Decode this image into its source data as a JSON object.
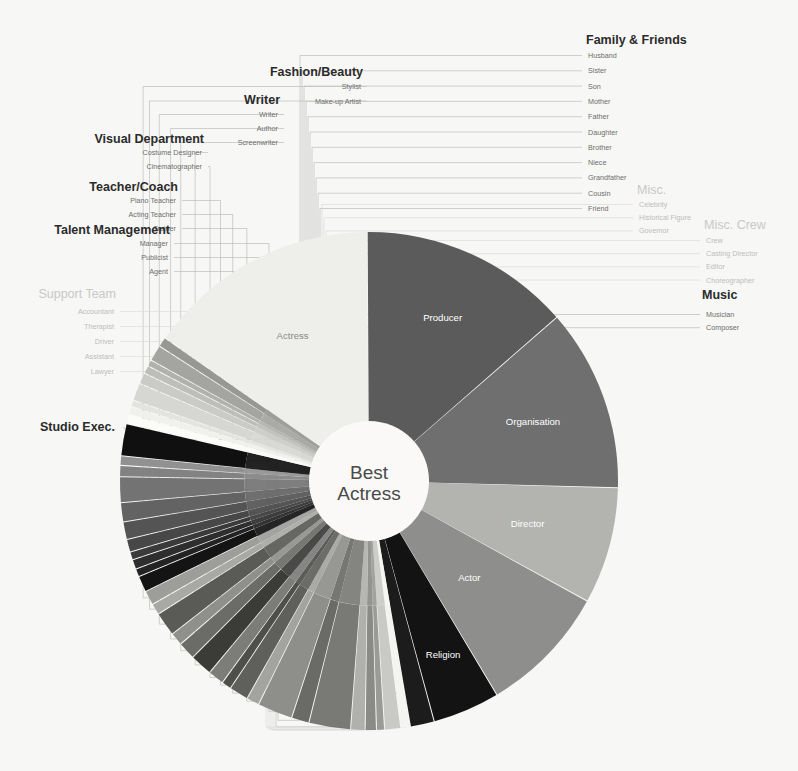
{
  "center": {
    "line1": "Best",
    "line2": "Actress"
  },
  "groups": [
    {
      "id": "family-friends",
      "title": "Family & Friends",
      "muted": false,
      "items": [
        "Husband",
        "Sister",
        "Son",
        "Mother",
        "Father",
        "Daughter",
        "Brother",
        "Niece",
        "Grandfather",
        "Cousin",
        "Friend"
      ]
    },
    {
      "id": "misc",
      "title": "Misc.",
      "muted": true,
      "items": [
        "Celebrity",
        "Historical Figure",
        "Governor"
      ]
    },
    {
      "id": "misc-crew",
      "title": "Misc. Crew",
      "muted": true,
      "items": [
        "Crew",
        "Casting Director",
        "Editor",
        "Choreographer"
      ]
    },
    {
      "id": "music",
      "title": "Music",
      "muted": false,
      "items": [
        "Musician",
        "Composer"
      ]
    },
    {
      "id": "fashion-beauty",
      "title": "Fashion/Beauty",
      "muted": false,
      "items": [
        "Stylist",
        "Make-up Artist"
      ]
    },
    {
      "id": "writer",
      "title": "Writer",
      "muted": false,
      "items": [
        "Writer",
        "Author",
        "Screenwriter"
      ]
    },
    {
      "id": "visual-department",
      "title": "Visual Department",
      "muted": false,
      "items": [
        "Costume Designer",
        "Cinematographer"
      ]
    },
    {
      "id": "teacher-coach",
      "title": "Teacher/Coach",
      "muted": false,
      "items": [
        "Piano Teacher",
        "Acting Teacher",
        "Trainer"
      ]
    },
    {
      "id": "talent-management",
      "title": "Talent Management",
      "muted": false,
      "items": [
        "Manager",
        "Publicist",
        "Agent"
      ]
    },
    {
      "id": "support-team",
      "title": "Support Team",
      "muted": true,
      "items": [
        "Accountant",
        "Therapist",
        "Driver",
        "Assistant",
        "Lawyer"
      ]
    },
    {
      "id": "studio-exec",
      "title": "Studio Exec.",
      "muted": false,
      "items": []
    }
  ],
  "chart_data": {
    "type": "pie",
    "subtitle": "",
    "xlabel": "",
    "ylabel": "",
    "units": "share of thank-you mentions (%)",
    "hole_ratio": 0.225,
    "start_angle_deg": -55,
    "direction": "clockwise",
    "legend_position": "callout-labels",
    "grid": false,
    "labels": [
      "Actress",
      "Producer",
      "Organisation",
      "Director",
      "Actor",
      "Religion",
      "Studio Exec.",
      "Lawyer",
      "Assistant",
      "Driver",
      "Therapist",
      "Accountant",
      "Agent",
      "Publicist",
      "Manager",
      "Trainer",
      "Acting Teacher",
      "Piano Teacher",
      "Cinematographer",
      "Costume Designer",
      "Screenwriter",
      "Author",
      "Writer",
      "Make-up Artist",
      "Stylist",
      "Friend",
      "Cousin",
      "Grandfather",
      "Niece",
      "Brother",
      "Daughter",
      "Father",
      "Mother",
      "Son",
      "Sister",
      "Husband",
      "Celebrity",
      "Historical Figure",
      "Governor",
      "Crew",
      "Casting Director",
      "Editor",
      "Choreographer",
      "Musician",
      "Composer"
    ],
    "values": [
      14.6,
      13.2,
      11.4,
      7.3,
      8.1,
      4.2,
      1.5,
      0.6,
      1.0,
      0.5,
      0.7,
      0.9,
      2.6,
      1.1,
      2.2,
      0.8,
      1.2,
      0.6,
      1.0,
      1.4,
      1.1,
      0.8,
      1.5,
      0.7,
      0.9,
      1.0,
      0.5,
      0.6,
      0.5,
      0.8,
      1.1,
      1.2,
      1.6,
      0.7,
      0.6,
      2.0,
      0.6,
      0.5,
      0.4,
      1.1,
      0.7,
      0.5,
      0.4,
      1.0,
      0.6
    ],
    "colors": [
      "#eeeeea",
      "#5b5b5b",
      "#6f6f6f",
      "#b3b3b0",
      "#8e8e8c",
      "#131313",
      "#1c1c1c",
      "#f4f4f1",
      "#c9c9c6",
      "#9a9a97",
      "#8a8a87",
      "#b0b0ad",
      "#797976",
      "#6a6a67",
      "#8e8e8b",
      "#a3a3a0",
      "#5f5f5c",
      "#4e4e4b",
      "#7c7c79",
      "#3b3b38",
      "#6b6b68",
      "#8f8f8c",
      "#5a5a57",
      "#a8a8a5",
      "#9d9d9a",
      "#141414",
      "#232323",
      "#2e2e2e",
      "#3a3a3a",
      "#474747",
      "#545454",
      "#636363",
      "#737373",
      "#828282",
      "#919191",
      "#101010",
      "#fbfbf8",
      "#f0f0ed",
      "#e3e3e0",
      "#d6d6d3",
      "#cacac7",
      "#bdbdba",
      "#b0b0ad",
      "#a4a4a1",
      "#979794"
    ]
  },
  "colors": {
    "background": "#f7f7f5",
    "hub": "#faf9f7",
    "leader": "#b9b9b7",
    "leader_pale": "#dadad8",
    "label_dark": "#2b2b2b",
    "label_mid": "#6e6e6e",
    "label_pale": "#c9c9c7",
    "slice_label_light": "#ffffff",
    "slice_label_dark": "#8a8a8a"
  }
}
